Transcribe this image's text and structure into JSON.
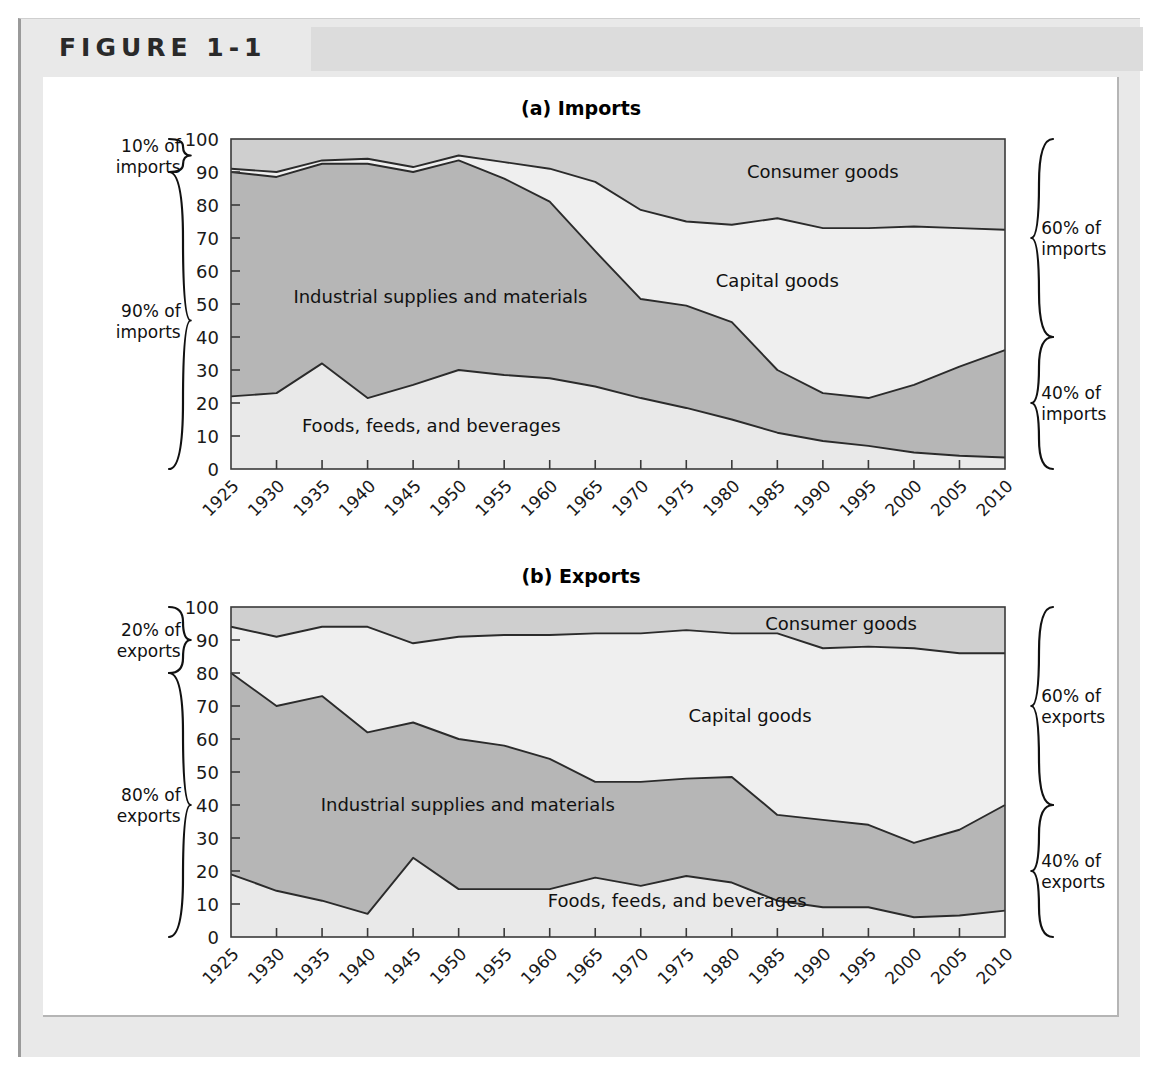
{
  "figure": {
    "label": "FIGURE 1-1"
  },
  "panels": [
    {
      "id": "imports",
      "title": "(a) Imports",
      "left_braces": [
        {
          "name": "brace-10-percent-imports",
          "label_line1": "10% of",
          "label_line2": "imports",
          "from": 90,
          "to": 100
        },
        {
          "name": "brace-90-percent-imports",
          "label_line1": "90% of",
          "label_line2": "imports",
          "from": 0,
          "to": 90
        }
      ],
      "right_braces": [
        {
          "name": "brace-60-percent-imports",
          "label_line1": "60% of",
          "label_line2": "imports",
          "from": 40,
          "to": 100
        },
        {
          "name": "brace-40-percent-imports",
          "label_line1": "40% of",
          "label_line2": "imports",
          "from": 0,
          "to": 40
        }
      ],
      "area_labels": [
        {
          "name": "area-label-consumer-goods",
          "text": "Consumer goods",
          "x": 1990,
          "y": 90
        },
        {
          "name": "area-label-capital-goods",
          "text": "Capital goods",
          "x": 1985,
          "y": 57
        },
        {
          "name": "area-label-industrial-supplies",
          "text": "Industrial supplies and materials",
          "x": 1948,
          "y": 52
        },
        {
          "name": "area-label-foods",
          "text": "Foods, feeds, and beverages",
          "x": 1947,
          "y": 13
        }
      ]
    },
    {
      "id": "exports",
      "title": "(b) Exports",
      "left_braces": [
        {
          "name": "brace-20-percent-exports",
          "label_line1": "20% of",
          "label_line2": "exports",
          "from": 80,
          "to": 100
        },
        {
          "name": "brace-80-percent-exports",
          "label_line1": "80% of",
          "label_line2": "exports",
          "from": 0,
          "to": 80
        }
      ],
      "right_braces": [
        {
          "name": "brace-60-percent-exports",
          "label_line1": "60% of",
          "label_line2": "exports",
          "from": 40,
          "to": 100
        },
        {
          "name": "brace-40-percent-exports",
          "label_line1": "40% of",
          "label_line2": "exports",
          "from": 0,
          "to": 40
        }
      ],
      "area_labels": [
        {
          "name": "area-label-consumer-goods",
          "text": "Consumer goods",
          "x": 1992,
          "y": 95
        },
        {
          "name": "area-label-capital-goods",
          "text": "Capital goods",
          "x": 1982,
          "y": 67
        },
        {
          "name": "area-label-industrial-supplies",
          "text": "Industrial supplies and materials",
          "x": 1951,
          "y": 40
        },
        {
          "name": "area-label-foods",
          "text": "Foods, feeds, and beverages",
          "x": 1974,
          "y": 11
        }
      ]
    }
  ],
  "colors": {
    "foods": "#e9e9e9",
    "industrial": "#b6b6b6",
    "capital": "#efefef",
    "consumer": "#cfcfcf",
    "line": "#2b2b2b",
    "frame_band": "#dcdcdc",
    "outer_bg": "#e9e9e9"
  },
  "chart_data": [
    {
      "type": "area",
      "stacked": true,
      "title": "(a) Imports",
      "xlabel": "",
      "ylabel": "",
      "ylim": [
        0,
        100
      ],
      "yticks": [
        0,
        10,
        20,
        30,
        40,
        50,
        60,
        70,
        80,
        90,
        100
      ],
      "grid": false,
      "legend": "inline-area-labels",
      "x": [
        1925,
        1930,
        1935,
        1940,
        1945,
        1950,
        1955,
        1960,
        1965,
        1970,
        1975,
        1980,
        1985,
        1990,
        1995,
        2000,
        2005,
        2010
      ],
      "series": [
        {
          "name": "Foods, feeds, and beverages",
          "values": [
            22,
            23,
            32,
            21.5,
            25.5,
            30,
            28.5,
            27.5,
            25,
            21.5,
            18.5,
            15,
            11,
            8.5,
            7,
            5,
            4,
            3.5
          ]
        },
        {
          "name": "Industrial supplies and materials",
          "values": [
            68,
            65.5,
            60.5,
            71,
            64.5,
            63.5,
            59.5,
            53.5,
            41,
            30,
            31,
            29.5,
            19,
            14.5,
            14.5,
            20.5,
            27,
            32.5
          ]
        },
        {
          "name": "Capital goods",
          "values": [
            1,
            1.5,
            1,
            1.5,
            1.5,
            1.5,
            5,
            10,
            21,
            27,
            25.5,
            29.5,
            46,
            50,
            51.5,
            48,
            42,
            36.5
          ]
        },
        {
          "name": "Consumer goods",
          "values": [
            9,
            10,
            6.5,
            6,
            8.5,
            5,
            7,
            9,
            13,
            21.5,
            25,
            26,
            24,
            27,
            27,
            26.5,
            27,
            27.5
          ]
        }
      ],
      "cumulative_boundaries": {
        "foods_top": [
          22,
          23,
          32,
          21.5,
          25.5,
          30,
          28.5,
          27.5,
          25,
          21.5,
          18.5,
          15,
          11,
          8.5,
          7,
          5,
          4,
          3.5
        ],
        "industrial_top": [
          90,
          88.5,
          92.5,
          92.5,
          90,
          93.5,
          88,
          81,
          66,
          51.5,
          49.5,
          44.5,
          30,
          23,
          21.5,
          25.5,
          31,
          36
        ],
        "capital_top": [
          91,
          90,
          93.5,
          94,
          91.5,
          95,
          93,
          91,
          87,
          78.5,
          75,
          74,
          76,
          73,
          73,
          73.5,
          73,
          72.5
        ],
        "consumer_top": [
          100,
          100,
          100,
          100,
          100,
          100,
          100,
          100,
          100,
          100,
          100,
          100,
          100,
          100,
          100,
          100,
          100,
          100
        ]
      }
    },
    {
      "type": "area",
      "stacked": true,
      "title": "(b) Exports",
      "xlabel": "",
      "ylabel": "",
      "ylim": [
        0,
        100
      ],
      "yticks": [
        0,
        10,
        20,
        30,
        40,
        50,
        60,
        70,
        80,
        90,
        100
      ],
      "grid": false,
      "legend": "inline-area-labels",
      "x": [
        1925,
        1930,
        1935,
        1940,
        1945,
        1950,
        1955,
        1960,
        1965,
        1970,
        1975,
        1980,
        1985,
        1990,
        1995,
        2000,
        2005,
        2010
      ],
      "series": [
        {
          "name": "Foods, feeds, and beverages",
          "values": [
            19,
            14,
            11,
            7,
            24,
            14.5,
            14.5,
            14.5,
            18,
            15.5,
            18.5,
            16.5,
            11,
            9,
            9,
            6,
            6.5,
            8
          ]
        },
        {
          "name": "Industrial supplies and materials",
          "values": [
            61,
            56,
            62,
            55,
            41,
            45.5,
            43.5,
            39.5,
            29,
            31.5,
            29.5,
            32,
            26,
            26.5,
            25,
            22.5,
            26,
            32
          ]
        },
        {
          "name": "Capital goods",
          "values": [
            14,
            21,
            21,
            32,
            24,
            31,
            33.5,
            37.5,
            45,
            45,
            45,
            43.5,
            55,
            52,
            54,
            59,
            53.5,
            46
          ]
        },
        {
          "name": "Consumer goods",
          "values": [
            6,
            9,
            6,
            6,
            11,
            9,
            8.5,
            8.5,
            8,
            8,
            7,
            8,
            8,
            12.5,
            12,
            12.5,
            14,
            14
          ]
        }
      ],
      "cumulative_boundaries": {
        "foods_top": [
          19,
          14,
          11,
          7,
          24,
          14.5,
          14.5,
          14.5,
          18,
          15.5,
          18.5,
          16.5,
          11,
          9,
          9,
          6,
          6.5,
          8
        ],
        "industrial_top": [
          80,
          70,
          73,
          62,
          65,
          60,
          58,
          54,
          47,
          47,
          48,
          48.5,
          37,
          35.5,
          34,
          28.5,
          32.5,
          40
        ],
        "capital_top": [
          94,
          91,
          94,
          94,
          89,
          91,
          91.5,
          91.5,
          92,
          92,
          93,
          92,
          92,
          87.5,
          88,
          87.5,
          86,
          86
        ],
        "consumer_top": [
          100,
          100,
          100,
          100,
          100,
          100,
          100,
          100,
          100,
          100,
          100,
          100,
          100,
          100,
          100,
          100,
          100,
          100
        ]
      }
    }
  ]
}
